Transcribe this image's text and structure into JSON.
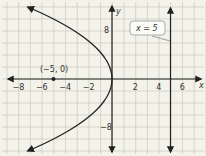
{
  "chart_data": {
    "type": "line",
    "title": "",
    "xlabel": "x",
    "ylabel": "y",
    "xlim": [
      -9,
      8
    ],
    "ylim": [
      -13,
      13
    ],
    "x_ticks": [
      -8,
      -6,
      -4,
      -2,
      2,
      4,
      6
    ],
    "x_tick_labels": [
      "−8",
      "−6",
      "−4",
      "−2",
      "2",
      "4",
      "6"
    ],
    "y_ticks": [
      8,
      -8
    ],
    "y_tick_labels": [
      "8",
      "−8"
    ],
    "grid": true,
    "series": [
      {
        "name": "parabola y^2 = -20x",
        "equation": "y^2 = -20x",
        "vertex": [
          0,
          0
        ],
        "opens": "left",
        "x": [
          -7,
          -5,
          -3.2,
          -1.8,
          -0.8,
          -0.2,
          0,
          -0.2,
          -0.8,
          -1.8,
          -3.2,
          -5,
          -7
        ],
        "y": [
          11.8,
          10,
          8,
          6,
          4,
          2,
          0,
          -2,
          -4,
          -6,
          -8,
          -10,
          -11.8
        ]
      },
      {
        "name": "directrix",
        "equation": "x = 5",
        "x": [
          5,
          5
        ],
        "y": [
          -13,
          13
        ]
      }
    ],
    "points": [
      {
        "label": "(−5, 0)",
        "x": -5,
        "y": 0
      }
    ],
    "annotations": [
      {
        "text": "x = 5",
        "target": "directrix"
      }
    ]
  },
  "labels": {
    "x_axis": "x",
    "y_axis": "y",
    "focus_point": "(−5, 0)",
    "directrix_callout": "x = 5",
    "x_ticks": [
      "−8",
      "−6",
      "−4",
      "−2",
      "2",
      "4",
      "6"
    ],
    "y_top": "8",
    "y_bottom": "−8"
  },
  "colors": {
    "background": "#f4f3ea",
    "grid": "#c9c9c0",
    "curve": "#222222",
    "axis": "#222222",
    "callout_border": "#888888"
  }
}
